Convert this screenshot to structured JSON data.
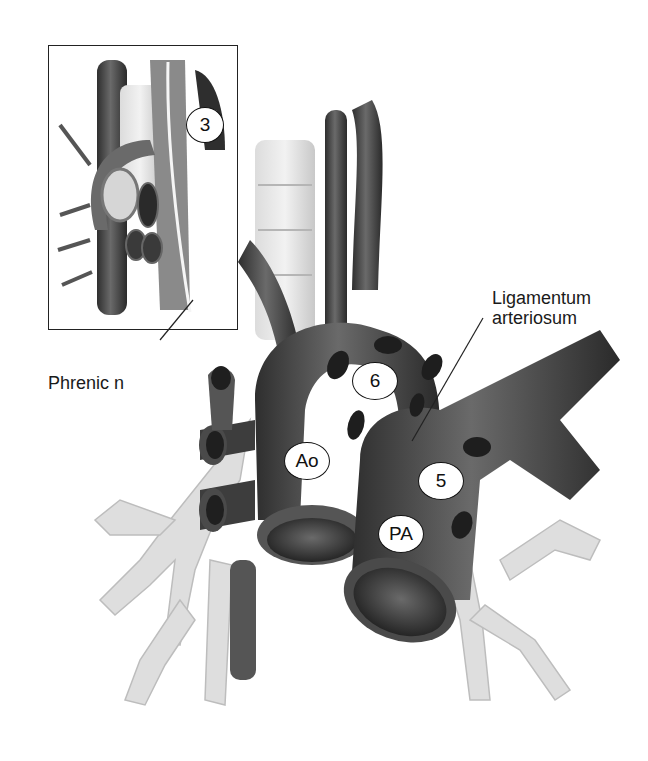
{
  "figure": {
    "type": "anatomical-illustration",
    "inset_present": true
  },
  "labels": {
    "phrenic": "Phrenic n",
    "ligamentum_line1": "Ligamentum",
    "ligamentum_line2": "arteriosum"
  },
  "markers": {
    "station_3": "3",
    "station_6": "6",
    "station_5": "5",
    "aorta": "Ao",
    "pulmonary_artery": "PA"
  },
  "colors": {
    "background": "#ffffff",
    "vessel_dark": "#3a3a3a",
    "vessel_mid": "#6e6e6e",
    "airway_light": "#d9d9d9",
    "node_black": "#1e1e1e",
    "frame": "#222222"
  }
}
